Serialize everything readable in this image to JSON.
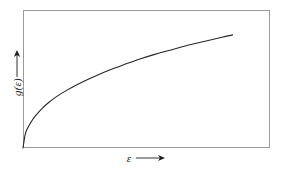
{
  "figure": {
    "background_color": "#ffffff",
    "frame_color": "#9a9a9a",
    "curve_color": "#262626",
    "text_color": "#1c1c1c",
    "y_axis": {
      "label": "g(ε)",
      "arrow_icon": "up-arrow-icon",
      "arrow_direction": "up"
    },
    "x_axis": {
      "label": "ε",
      "arrow_icon": "right-arrow-icon",
      "arrow_direction": "right"
    }
  },
  "chart_data": {
    "type": "line",
    "title": "",
    "xlabel": "ε",
    "ylabel": "g(ε)",
    "grid": false,
    "legend": null,
    "axis_ticks": false,
    "axis_tick_labels": [],
    "xlim": [
      0,
      1
    ],
    "ylim": [
      0,
      1
    ],
    "series": [
      {
        "name": "g(ε)",
        "description": "square-root-like rising curve, steep near origin then flattening",
        "x": [
          0.0,
          0.01,
          0.02,
          0.04,
          0.06,
          0.09,
          0.12,
          0.16,
          0.2,
          0.25,
          0.3,
          0.36,
          0.42,
          0.48,
          0.55,
          0.62,
          0.7,
          0.78,
          0.86,
          0.93,
          0.98
        ],
        "y": [
          0.0,
          0.115,
          0.165,
          0.23,
          0.28,
          0.34,
          0.39,
          0.445,
          0.49,
          0.54,
          0.585,
          0.635,
          0.68,
          0.72,
          0.765,
          0.805,
          0.845,
          0.885,
          0.92,
          0.95,
          0.97
        ]
      }
    ]
  }
}
